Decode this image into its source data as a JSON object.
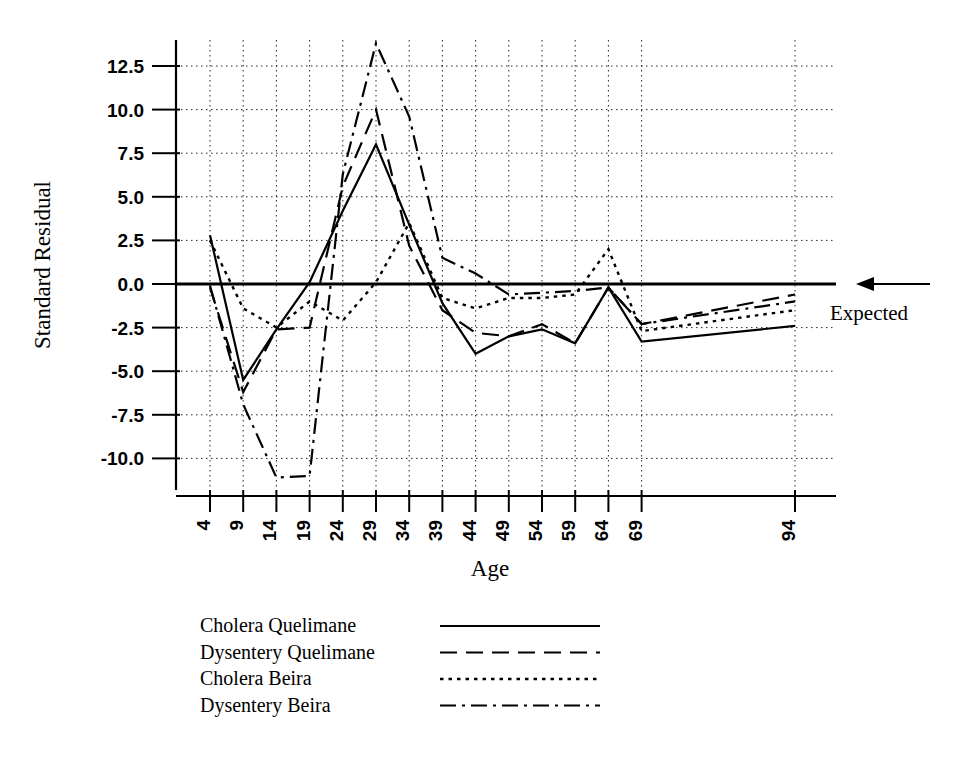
{
  "chart_data": {
    "type": "line",
    "title": "",
    "xlabel": "Age",
    "ylabel": "Standard Residual",
    "x": [
      4,
      9,
      14,
      19,
      24,
      29,
      34,
      39,
      44,
      49,
      54,
      59,
      64,
      69,
      94
    ],
    "xtick_labels": [
      "4",
      "9",
      "14",
      "19",
      "24",
      "29",
      "34",
      "39",
      "44",
      "49",
      "54",
      "59",
      "64",
      "69",
      "94"
    ],
    "ytick_labels": [
      "12.5",
      "10.0",
      "7.5",
      "5.0",
      "2.5",
      "0.0",
      "-2.5",
      "-5.0",
      "-7.5",
      "-10.0"
    ],
    "ytick_values": [
      12.5,
      10.0,
      7.5,
      5.0,
      2.5,
      0.0,
      -2.5,
      -5.0,
      -7.5,
      -10.0
    ],
    "ylim": [
      -12.5,
      14.5
    ],
    "xlim": [
      4,
      94
    ],
    "grid": true,
    "legend_position": "below-plot",
    "annotations": [
      {
        "text": "Expected",
        "target_y": 0.0,
        "arrow": "left"
      }
    ],
    "series": [
      {
        "name": "Cholera Quelimane",
        "style": "solid",
        "values": [
          2.8,
          -5.5,
          -2.6,
          0.1,
          4.2,
          8.0,
          3.4,
          -1.1,
          -4.0,
          -3.0,
          -2.6,
          -3.4,
          -0.2,
          -3.3,
          -2.4
        ]
      },
      {
        "name": "Dysentery Quelimane",
        "style": "dashed",
        "values": [
          -0.2,
          -6.2,
          -2.6,
          -2.5,
          5.6,
          10.0,
          2.2,
          -1.5,
          -2.8,
          -3.0,
          -2.3,
          -3.4,
          -0.2,
          -2.3,
          -0.6
        ]
      },
      {
        "name": "Cholera Beira",
        "style": "dotted",
        "values": [
          2.5,
          -1.4,
          -2.5,
          -1.0,
          -2.1,
          0.1,
          3.5,
          -0.8,
          -1.4,
          -0.8,
          -0.8,
          -0.6,
          2.0,
          -2.7,
          -1.5
        ]
      },
      {
        "name": "Dysentery Beira",
        "style": "dashdot",
        "values": [
          -0.1,
          -6.9,
          -11.1,
          -11.0,
          6.3,
          13.8,
          9.6,
          1.5,
          0.6,
          -0.6,
          -0.5,
          -0.4,
          -0.2,
          -2.3,
          -1.0
        ]
      }
    ]
  },
  "legend": {
    "entries": [
      {
        "label": "Cholera Quelimane",
        "style": "solid"
      },
      {
        "label": "Dysentery Quelimane",
        "style": "dashed"
      },
      {
        "label": "Cholera Beira",
        "style": "dotted"
      },
      {
        "label": "Dysentery Beira",
        "style": "dashdot"
      }
    ]
  },
  "colors": {
    "ink": "#000000",
    "paper": "#ffffff"
  }
}
